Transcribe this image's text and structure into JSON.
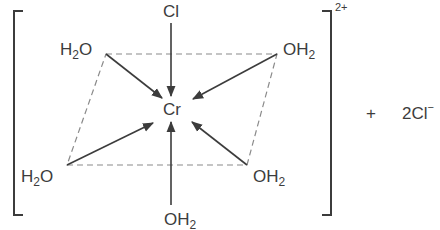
{
  "diagram": {
    "colors": {
      "ink": "#3c3c3c",
      "dashed_plane": "#8a8a8a",
      "background": "#ffffff"
    },
    "metal": {
      "symbol": "Cr",
      "x": 172,
      "y": 115
    },
    "complex_charge": "2+",
    "ligands": [
      {
        "id": "axial-top",
        "main": "Cl",
        "sub": "",
        "tail": "",
        "position": "top"
      },
      {
        "id": "eq-top-left",
        "main": "H",
        "sub": "2",
        "tail": "O",
        "position": "top-left"
      },
      {
        "id": "eq-top-right",
        "main": "OH",
        "sub": "2",
        "tail": "",
        "position": "top-right"
      },
      {
        "id": "eq-bottom-left",
        "main": "H",
        "sub": "2",
        "tail": "O",
        "position": "bottom-left"
      },
      {
        "id": "eq-bottom-right",
        "main": "OH",
        "sub": "2",
        "tail": "",
        "position": "bottom-right"
      },
      {
        "id": "axial-bottom",
        "main": "OH",
        "sub": "2",
        "tail": "",
        "position": "bottom"
      }
    ],
    "counterion": {
      "plus": "+",
      "coefficient": "2",
      "symbol": "Cl",
      "charge": "−"
    },
    "plane_vertices": [
      [
        106,
        54
      ],
      [
        277,
        54
      ],
      [
        247,
        165
      ],
      [
        67,
        165
      ]
    ]
  }
}
